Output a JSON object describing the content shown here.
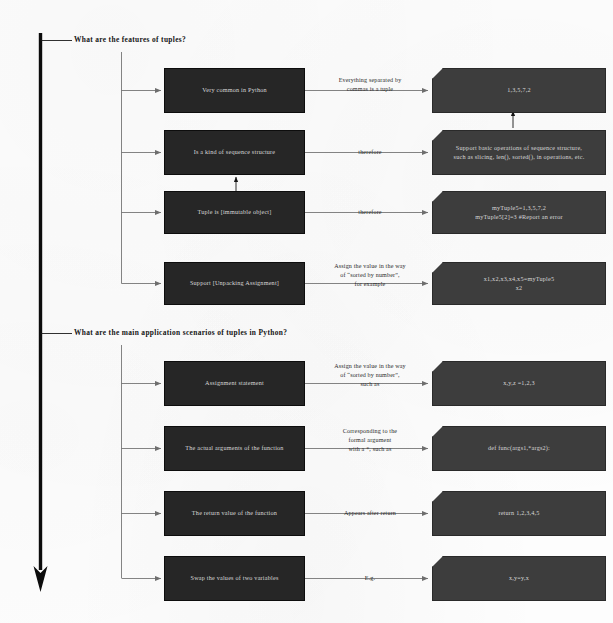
{
  "document": {
    "title": "Tuples in Python mind map"
  },
  "sections": [
    {
      "id": "features",
      "heading": "What are the features of tuples?",
      "rows": [
        {
          "left": "Very common in Python",
          "edge": "Everything separated by\ncommas is a tuple",
          "right": "1,3,5,7,2"
        },
        {
          "left": "Is a kind of sequence structure",
          "edge": "therefore",
          "right": "Support basic operations of sequence structure,\nsuch as slicing, len(), sorted(), in operations, etc."
        },
        {
          "left": "Tuple is [immutable object]",
          "edge": "therefore",
          "right": "myTuple5=1,3,5,7,2\nmyTuple5[2]=3  #Report an error"
        },
        {
          "left": "Support [Unpacking Assignment]",
          "edge": "Assign the value in the way\nof “sorted by number”,\nfor example",
          "right": "x1,x2,x3,x4,x5=myTuple5\nx2"
        }
      ]
    },
    {
      "id": "scenarios",
      "heading": "What are the main application scenarios of tuples in Python?",
      "rows": [
        {
          "left": "Assignment statement",
          "edge": "Assign the value in the way\nof “sorted by number”,\nsuch as",
          "right": "x,y,z =1,2,3"
        },
        {
          "left": "The actual arguments of the function",
          "edge": "Corresponding to the\nformal argument\nwith a *, such as",
          "right": "def func(args1,*args2):"
        },
        {
          "left": "The return value of the function",
          "edge": "Appears after return",
          "right": "return 1,2,3,4,5"
        },
        {
          "left": "Swap the values of two variables",
          "edge": "E.g.",
          "right": "x,y=y,x"
        }
      ]
    }
  ],
  "colors": {
    "left_box": "#262626",
    "right_box": "#3d3d3d",
    "box_text": "#d8d8d8",
    "connector": "#6e6e6e",
    "spine": "#111111",
    "page": "#fdfdfd"
  }
}
